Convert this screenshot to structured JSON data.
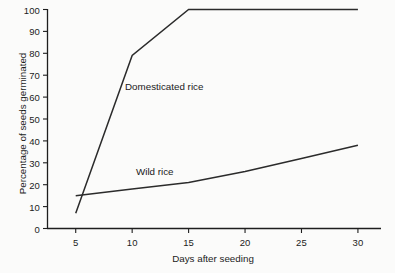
{
  "chart_data": {
    "type": "line",
    "title": "",
    "xlabel": "Days after seeding",
    "ylabel": "Percentage of seeds germinated",
    "xlim": [
      2.5,
      32
    ],
    "ylim": [
      0,
      100
    ],
    "xticks": [
      5,
      10,
      15,
      20,
      25,
      30
    ],
    "yticks": [
      0,
      10,
      20,
      30,
      40,
      50,
      60,
      70,
      80,
      90,
      100
    ],
    "xtick_labels": [
      "5",
      "10",
      "15",
      "20",
      "25",
      "30"
    ],
    "ytick_labels": [
      "0",
      "10",
      "20",
      "30",
      "40",
      "50",
      "60",
      "70",
      "80",
      "90",
      "100"
    ],
    "grid": false,
    "legend_position": "inline-annotation",
    "line_color": "#2b2b2b",
    "series": [
      {
        "name": "Domesticated rice",
        "annotation": "Domesticated rice",
        "x": [
          5,
          10,
          15,
          20,
          25,
          30
        ],
        "values": [
          7,
          79,
          100,
          100,
          100,
          100
        ]
      },
      {
        "name": "Wild rice",
        "annotation": "Wild rice",
        "x": [
          5,
          10,
          15,
          20,
          25,
          30
        ],
        "values": [
          15,
          18,
          21,
          26,
          32,
          38
        ]
      }
    ]
  },
  "axes": {
    "x_title": "Days after seeding",
    "y_title": "Percentage of seeds germinated"
  },
  "annotations": {
    "domesticated": "Domesticated rice",
    "wild": "Wild rice"
  },
  "colors": {
    "line": "#2b2b2b",
    "axis": "#1e1e1e",
    "background": "#fbfbfa",
    "text": "#1c1c1c"
  }
}
